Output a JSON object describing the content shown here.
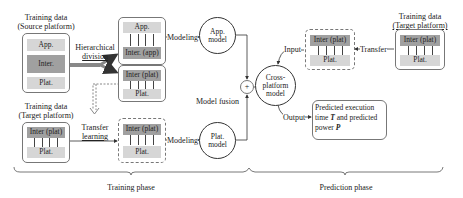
{
  "diagram": {
    "source_training": {
      "title_line1": "Training data",
      "title_line2": "(Source platform)",
      "layers": [
        "App.",
        "Inter.",
        "Plat."
      ]
    },
    "hierarchical_division_line1": "Hierarchical",
    "hierarchical_division_line2": "division",
    "app_inter_box": {
      "top": "App.",
      "bottom": "Inter. (app)"
    },
    "inter_plat_box": {
      "top": "Inter (plat)",
      "bottom": "Plat."
    },
    "target_training": {
      "title_line1": "Training data",
      "title_line2": "(Target platform)",
      "top": "Inter (plat)",
      "bottom": "Plat."
    },
    "transfer_learning_line1": "Transfer",
    "transfer_learning_line2": "learning",
    "transferred_box": {
      "top": "Inter (plat)",
      "bottom": "Plat."
    },
    "modeling_label": "Modeling",
    "app_model": {
      "line1": "App.",
      "line2": "model"
    },
    "plat_model": {
      "line1": "Plat.",
      "line2": "model"
    },
    "model_fusion": "Model fusion",
    "plus_symbol": "+",
    "cross_platform_model": {
      "line1": "Cross-",
      "line2": "platform",
      "line3": "model"
    },
    "input_label": "Input",
    "output_label": "Output",
    "prediction_input_box": {
      "top": "Inter (plat)",
      "bottom": "Plat."
    },
    "transfer_label": "Transfer",
    "target_prediction": {
      "title_line1": "Training data",
      "title_line2": "(Target platform)",
      "top": "Inter (plat)",
      "bottom": "Plat."
    },
    "output_box": {
      "line1": "Predicted execution",
      "line2_pre": "time ",
      "line2_var": "T",
      "line2_post": " and predicted",
      "line3_pre": "power ",
      "line3_var": "P"
    },
    "phases": {
      "training": "Training phase",
      "prediction": "Prediction phase"
    }
  }
}
